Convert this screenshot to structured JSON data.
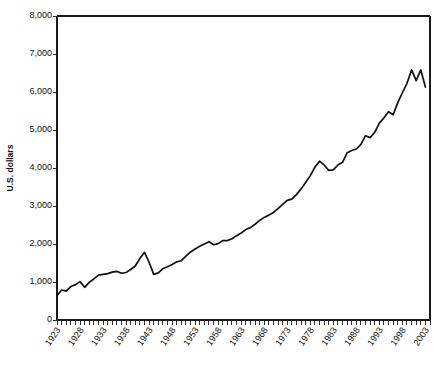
{
  "chart_data": {
    "type": "line",
    "title": "",
    "xlabel": "",
    "ylabel": "U.S. dollars",
    "xlim": [
      1923,
      2004
    ],
    "ylim": [
      0,
      8000
    ],
    "grid": false,
    "legend": null,
    "y_ticks": [
      0,
      1000,
      2000,
      3000,
      4000,
      5000,
      6000,
      7000,
      8000
    ],
    "y_tick_labels": [
      "0",
      "1,000",
      "2,000",
      "3,000",
      "4,000",
      "5,000",
      "6,000",
      "7,000",
      "8,000"
    ],
    "x_tick_labels": [
      "1923",
      "1928",
      "1933",
      "1938",
      "1943",
      "1948",
      "1953",
      "1958",
      "1963",
      "1968",
      "1973",
      "1978",
      "1983",
      "1988",
      "1993",
      "1998",
      "2003"
    ],
    "x_tick_label_step": 5,
    "x_minor_tick_step": 1,
    "series": [
      {
        "name": "U.S. dollars",
        "x": [
          1923,
          1924,
          1925,
          1926,
          1927,
          1928,
          1929,
          1930,
          1931,
          1932,
          1933,
          1934,
          1935,
          1936,
          1937,
          1938,
          1939,
          1940,
          1941,
          1942,
          1943,
          1944,
          1945,
          1946,
          1947,
          1948,
          1949,
          1950,
          1951,
          1952,
          1953,
          1954,
          1955,
          1956,
          1957,
          1958,
          1959,
          1960,
          1961,
          1962,
          1963,
          1964,
          1965,
          1966,
          1967,
          1968,
          1969,
          1970,
          1971,
          1972,
          1973,
          1974,
          1975,
          1976,
          1977,
          1978,
          1979,
          1980,
          1981,
          1982,
          1983,
          1984,
          1985,
          1986,
          1987,
          1988,
          1989,
          1990,
          1991,
          1992,
          1993,
          1994,
          1995,
          1996,
          1997,
          1998,
          1999,
          2000,
          2001,
          2002,
          2003
        ],
        "values": [
          640,
          790,
          760,
          880,
          930,
          1010,
          860,
          990,
          1080,
          1180,
          1200,
          1220,
          1260,
          1280,
          1230,
          1250,
          1330,
          1420,
          1620,
          1780,
          1520,
          1200,
          1240,
          1350,
          1400,
          1460,
          1530,
          1560,
          1680,
          1790,
          1870,
          1940,
          2000,
          2060,
          1980,
          2010,
          2090,
          2090,
          2140,
          2220,
          2290,
          2380,
          2430,
          2520,
          2620,
          2700,
          2760,
          2830,
          2930,
          3040,
          3150,
          3180,
          3300,
          3450,
          3620,
          3800,
          4020,
          4180,
          4080,
          3940,
          3950,
          4080,
          4150,
          4400,
          4460,
          4500,
          4620,
          4850,
          4800,
          4940,
          5180,
          5320,
          5480,
          5400,
          5720,
          5980,
          6230,
          6580,
          6300,
          6580,
          6130
        ]
      }
    ]
  },
  "axis": {
    "y_title": "U.S. dollars"
  }
}
